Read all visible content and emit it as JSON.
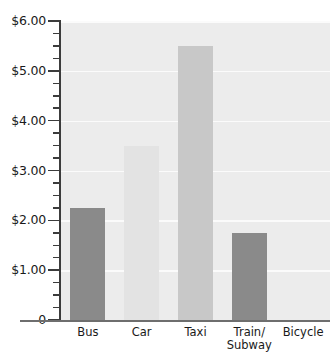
{
  "chart_data": {
    "type": "bar",
    "title": "",
    "subtitle": "",
    "xlabel": "",
    "ylabel": "",
    "categories": [
      "Bus",
      "Car",
      "Taxi",
      "Train/\nSubway",
      "Bicycle"
    ],
    "values": [
      2.25,
      3.5,
      5.5,
      1.75,
      0
    ],
    "value_labels": [
      "$2.25",
      "$3.50",
      "$5.50",
      "$1.75",
      "$0.00"
    ],
    "bar_colors": [
      "#8a8a8a",
      "#e3e3e3",
      "#c8c8c8",
      "#8a8a8a",
      "#ececec"
    ],
    "ylim": [
      0,
      6
    ],
    "ytick_values": [
      0,
      1,
      2,
      3,
      4,
      5,
      6
    ],
    "ytick_labels": [
      "0",
      "$1.00",
      "$2.00",
      "$3.00",
      "$4.00",
      "$5.00",
      "$6.00"
    ],
    "minor_tick_step": 0.25,
    "grid": true,
    "gridline_values": [
      1,
      2,
      3,
      4,
      5,
      6
    ],
    "legend": "none",
    "plot_background": "#ececec",
    "axis_color": "#3c3c3c",
    "gridline_color": "#fbfbfb"
  },
  "axis": {
    "y_labels": [
      {
        "text": "$6.00",
        "value": 6
      },
      {
        "text": "$5.00",
        "value": 5
      },
      {
        "text": "$4.00",
        "value": 4
      },
      {
        "text": "$3.00",
        "value": 3
      },
      {
        "text": "$2.00",
        "value": 2
      },
      {
        "text": "$1.00",
        "value": 1
      },
      {
        "text": "0",
        "value": 0
      }
    ],
    "x_labels": [
      {
        "text": "Bus"
      },
      {
        "text": "Car"
      },
      {
        "text": "Taxi"
      },
      {
        "text": "Train/\nSubway"
      },
      {
        "text": "Bicycle"
      }
    ]
  }
}
